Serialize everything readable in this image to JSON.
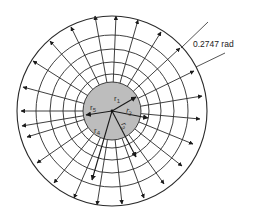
{
  "diagram": {
    "center": [
      112,
      111
    ],
    "core": {
      "radius": 29,
      "fill": "#bdbdbd"
    },
    "ring_radii": [
      37,
      49,
      62,
      76
    ],
    "outer_radius": 95,
    "ray_tips": [
      [
        116,
        16
      ],
      [
        138,
        20
      ],
      [
        161,
        32
      ],
      [
        180,
        48
      ],
      [
        194,
        71
      ],
      [
        202,
        96
      ],
      [
        200,
        119
      ],
      [
        193,
        144
      ],
      [
        182,
        166
      ],
      [
        164,
        184
      ],
      [
        144,
        198
      ],
      [
        122,
        204
      ],
      [
        97,
        205
      ],
      [
        74,
        198
      ],
      [
        54,
        183
      ],
      [
        37,
        163
      ],
      [
        27,
        137
      ],
      [
        22,
        126
      ],
      [
        21,
        111
      ],
      [
        23,
        87
      ],
      [
        33,
        61
      ],
      [
        50,
        41
      ],
      [
        71,
        27
      ],
      [
        95,
        16
      ]
    ],
    "inner_radii": [
      {
        "label": "r1",
        "name": "r1-radius",
        "tip": [
          136,
          97
        ]
      },
      {
        "label": "r2",
        "name": "r2-radius",
        "tip": [
          148,
          118
        ]
      },
      {
        "label": "r3",
        "name": "r3-radius",
        "tip": [
          136,
          157
        ]
      },
      {
        "label": "r4",
        "name": "r4-radius",
        "tip": [
          92,
          180
        ]
      },
      {
        "label": "r5",
        "name": "r5-radius",
        "tip": [
          86,
          115
        ]
      }
    ],
    "labels": {
      "r1": "r",
      "r1_sub": "1",
      "r2": "r",
      "r2_sub": "2",
      "r3": "r",
      "r3_sub": "3",
      "r4": "r",
      "r4_sub": "4",
      "r5": "r",
      "r5_sub": "5"
    },
    "angle_annotation": {
      "text": "0.2747 rad",
      "line1": [
        181,
        48,
        208,
        22
      ],
      "line2": [
        196,
        67,
        225,
        53
      ]
    },
    "colors": {
      "stroke": "#2a2a2a",
      "core_fill": "#bdbdbd",
      "background": "#ffffff"
    }
  }
}
